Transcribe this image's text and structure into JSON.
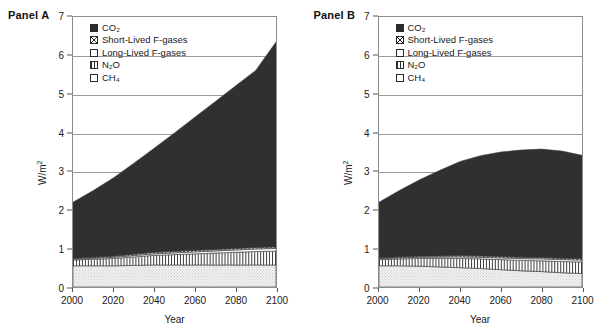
{
  "figure": {
    "panels": [
      {
        "id": "A",
        "label": "Panel A",
        "chart_data": {
          "type": "area",
          "stacked": true,
          "title": "Panel A",
          "xlabel": "Year",
          "ylabel": "W/m2",
          "ylabel_display": "W/m²",
          "xlim": [
            2000,
            2100
          ],
          "ylim": [
            0,
            7
          ],
          "grid": true,
          "legend_position": "top-left-inside",
          "xticks": [
            2000,
            2020,
            2040,
            2060,
            2080,
            2100
          ],
          "yticks": [
            0,
            1,
            2,
            3,
            4,
            5,
            6,
            7
          ],
          "x": [
            2000,
            2010,
            2020,
            2030,
            2040,
            2050,
            2060,
            2070,
            2080,
            2090,
            2100
          ],
          "series": [
            {
              "name": "CH4",
              "name_display": "CH₄",
              "pattern": "stipple",
              "color": "#ececec",
              "values": [
                0.55,
                0.55,
                0.55,
                0.56,
                0.57,
                0.57,
                0.57,
                0.57,
                0.57,
                0.57,
                0.57
              ]
            },
            {
              "name": "N2O",
              "name_display": "N₂O",
              "pattern": "vertical-lines",
              "color": "#ffffff",
              "values": [
                0.15,
                0.17,
                0.19,
                0.22,
                0.25,
                0.27,
                0.29,
                0.31,
                0.33,
                0.35,
                0.36
              ]
            },
            {
              "name": "Long-Lived F-gases",
              "name_display": "Long-Lived F-gases",
              "pattern": "empty",
              "color": "#ffffff",
              "values": [
                0.02,
                0.025,
                0.03,
                0.035,
                0.04,
                0.045,
                0.05,
                0.055,
                0.06,
                0.065,
                0.07
              ]
            },
            {
              "name": "Short-Lived F-gases",
              "name_display": "Short-Lived F-gases",
              "pattern": "x-hatch",
              "color": "#777777",
              "values": [
                0.02,
                0.025,
                0.03,
                0.035,
                0.04,
                0.04,
                0.04,
                0.04,
                0.04,
                0.04,
                0.04
              ]
            },
            {
              "name": "CO2",
              "name_display": "CO₂",
              "pattern": "solid",
              "color": "#303030",
              "values": [
                1.46,
                1.73,
                2.03,
                2.36,
                2.7,
                3.07,
                3.45,
                3.83,
                4.21,
                4.59,
                5.31
              ]
            }
          ],
          "totals": [
            2.2,
            2.5,
            2.83,
            3.19,
            3.6,
            4.0,
            4.4,
            4.8,
            5.21,
            5.62,
            6.35
          ],
          "notes": "Total radiative forcing rises approximately linearly from about 2.2 W/m2 in 2000 to about 6.35 W/m2 in 2100."
        }
      },
      {
        "id": "B",
        "label": "Panel B",
        "chart_data": {
          "type": "area",
          "stacked": true,
          "title": "Panel B",
          "xlabel": "Year",
          "ylabel": "W/m2",
          "ylabel_display": "W/m²",
          "xlim": [
            2000,
            2100
          ],
          "ylim": [
            0,
            7
          ],
          "grid": true,
          "legend_position": "top-left-inside",
          "xticks": [
            2000,
            2020,
            2040,
            2060,
            2080,
            2100
          ],
          "yticks": [
            0,
            1,
            2,
            3,
            4,
            5,
            6,
            7
          ],
          "x": [
            2000,
            2010,
            2020,
            2030,
            2040,
            2050,
            2060,
            2070,
            2080,
            2090,
            2100
          ],
          "series": [
            {
              "name": "CH4",
              "name_display": "CH₄",
              "pattern": "stipple",
              "color": "#ececec",
              "values": [
                0.55,
                0.55,
                0.54,
                0.52,
                0.5,
                0.48,
                0.45,
                0.42,
                0.4,
                0.37,
                0.35
              ]
            },
            {
              "name": "N2O",
              "name_display": "N₂O",
              "pattern": "vertical-lines",
              "color": "#ffffff",
              "values": [
                0.16,
                0.18,
                0.2,
                0.22,
                0.24,
                0.25,
                0.26,
                0.27,
                0.28,
                0.29,
                0.3
              ]
            },
            {
              "name": "Long-Lived F-gases",
              "name_display": "Long-Lived F-gases",
              "pattern": "empty",
              "color": "#ffffff",
              "values": [
                0.02,
                0.025,
                0.03,
                0.035,
                0.04,
                0.04,
                0.045,
                0.045,
                0.05,
                0.05,
                0.05
              ]
            },
            {
              "name": "Short-Lived F-gases",
              "name_display": "Short-Lived F-gases",
              "pattern": "x-hatch",
              "color": "#777777",
              "values": [
                0.02,
                0.025,
                0.03,
                0.03,
                0.035,
                0.035,
                0.035,
                0.035,
                0.035,
                0.035,
                0.035
              ]
            },
            {
              "name": "CO2",
              "name_display": "CO₂",
              "pattern": "solid",
              "color": "#303030",
              "values": [
                1.45,
                1.72,
                1.98,
                2.22,
                2.44,
                2.6,
                2.71,
                2.78,
                2.81,
                2.78,
                2.68
              ]
            }
          ],
          "totals": [
            2.2,
            2.5,
            2.78,
            3.03,
            3.25,
            3.4,
            3.5,
            3.55,
            3.57,
            3.52,
            3.41
          ],
          "notes": "Total radiative forcing rises from about 2.2 W/m2 in 2000, peaks near 3.2 W/m2 around 2080, then declines slightly by 2100."
        }
      }
    ],
    "legend": {
      "items": [
        {
          "label": "CO₂",
          "pattern": "solid"
        },
        {
          "label": "Short-Lived F-gases",
          "pattern": "x-hatch"
        },
        {
          "label": "Long-Lived F-gases",
          "pattern": "empty"
        },
        {
          "label": "N₂O",
          "pattern": "vertical-lines"
        },
        {
          "label": "CH₄",
          "pattern": "stipple"
        }
      ]
    },
    "axis": {
      "xlabel": "Year",
      "ylabel": "W/m²",
      "xticks": [
        "2000",
        "2020",
        "2040",
        "2060",
        "2080",
        "2100"
      ],
      "yticks": [
        "0",
        "1",
        "2",
        "3",
        "4",
        "5",
        "6",
        "7"
      ]
    },
    "colors": {
      "co2": "#303030",
      "short_lived": "#777777",
      "long_lived": "#ffffff",
      "n2o": "#ffffff",
      "ch4": "#ececec",
      "axis": "#8c8c8c",
      "grid": "#9a9a9a",
      "text": "#1a1a1a"
    }
  }
}
